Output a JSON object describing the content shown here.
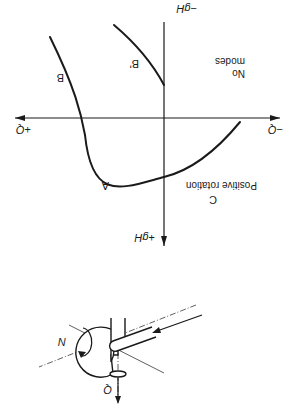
{
  "figure": {
    "orientation": "rotated 180 degrees",
    "chart": {
      "x_axis_positive_label": "+Q",
      "x_axis_negative_label": "−Q",
      "y_axis_positive_label": "+gH",
      "y_axis_negative_label": "−gH",
      "region_labels": {
        "no_modes_line1": "No",
        "no_modes_line2": "modes",
        "positive_rotation": "Positive rotation"
      },
      "curve_labels": {
        "A": "A",
        "B": "B",
        "B_prime": "B'",
        "C": "C"
      }
    },
    "pump": {
      "flow_label": "Q",
      "speed_label": "N"
    }
  }
}
